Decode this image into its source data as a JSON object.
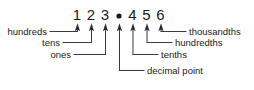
{
  "diagram": {
    "type": "place-value-chart",
    "number": "123.456",
    "colors": {
      "background": "#ffffff",
      "text": "#1a1a1a",
      "line": "#3a3a3a",
      "arrow": "#2b2b2b"
    },
    "digits": [
      {
        "glyph": "1",
        "place": "hundreds",
        "x": 77
      },
      {
        "glyph": "2",
        "place": "tens",
        "x": 91
      },
      {
        "glyph": "3",
        "place": "ones",
        "x": 105
      },
      {
        "glyph": ".",
        "place": "decimal point",
        "x": 119
      },
      {
        "glyph": "4",
        "place": "tenths",
        "x": 132
      },
      {
        "glyph": "5",
        "place": "hundredths",
        "x": 146
      },
      {
        "glyph": "6",
        "place": "thousandths",
        "x": 160
      }
    ],
    "labels": {
      "hundreds": "hundreds",
      "tens": "tens",
      "ones": "ones",
      "decimal_point": "decimal point",
      "tenths": "tenths",
      "hundredths": "hundredths",
      "thousandths": "thousandths"
    }
  }
}
